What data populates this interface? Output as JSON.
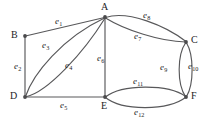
{
  "figure": {
    "type": "undirected-multigraph-diagram",
    "background_color": "#ffffff",
    "stroke_color": "#58585a",
    "text_color": "#1d1d1f",
    "width": 211,
    "height": 122
  },
  "vertices": [
    {
      "id": "A",
      "label": "A",
      "x": 105,
      "y": 17,
      "label_x": 101,
      "label_y": 2
    },
    {
      "id": "B",
      "label": "B",
      "x": 25,
      "y": 36,
      "label_x": 11,
      "label_y": 30
    },
    {
      "id": "C",
      "label": "C",
      "x": 186,
      "y": 42,
      "label_x": 191,
      "label_y": 35
    },
    {
      "id": "D",
      "label": "D",
      "x": 25,
      "y": 97,
      "label_x": 10,
      "label_y": 91
    },
    {
      "id": "E",
      "label": "E",
      "x": 105,
      "y": 97,
      "label_x": 101,
      "label_y": 101
    },
    {
      "id": "F",
      "label": "F",
      "x": 186,
      "y": 97,
      "label_x": 191,
      "label_y": 91
    }
  ],
  "edges": [
    {
      "id": "e1",
      "label": "e",
      "sub": "1",
      "from": "B",
      "to": "A",
      "shape": "straight",
      "label_x": 55,
      "label_y": 17
    },
    {
      "id": "e2",
      "label": "e",
      "sub": "2",
      "from": "B",
      "to": "D",
      "shape": "straight",
      "label_x": 14,
      "label_y": 62
    },
    {
      "id": "e3",
      "label": "e",
      "sub": "3",
      "from": "D",
      "to": "A",
      "shape": "curve-left",
      "label_x": 42,
      "label_y": 41
    },
    {
      "id": "e4",
      "label": "e",
      "sub": "4",
      "from": "D",
      "to": "A",
      "shape": "curve-right",
      "label_x": 65,
      "label_y": 61
    },
    {
      "id": "e5",
      "label": "e",
      "sub": "5",
      "from": "D",
      "to": "E",
      "shape": "straight",
      "label_x": 60,
      "label_y": 101
    },
    {
      "id": "e6",
      "label": "e",
      "sub": "6",
      "from": "A",
      "to": "E",
      "shape": "straight",
      "label_x": 97,
      "label_y": 54
    },
    {
      "id": "e7",
      "label": "e",
      "sub": "7",
      "from": "A",
      "to": "C",
      "shape": "curve-lower",
      "label_x": 134,
      "label_y": 32
    },
    {
      "id": "e8",
      "label": "e",
      "sub": "8",
      "from": "A",
      "to": "C",
      "shape": "curve-upper",
      "label_x": 143,
      "label_y": 11
    },
    {
      "id": "e9",
      "label": "e",
      "sub": "9",
      "from": "C",
      "to": "F",
      "shape": "curve-left",
      "label_x": 160,
      "label_y": 63
    },
    {
      "id": "e10",
      "label": "e",
      "sub": "10",
      "from": "C",
      "to": "F",
      "shape": "curve-right",
      "label_x": 188,
      "label_y": 62
    },
    {
      "id": "e11",
      "label": "e",
      "sub": "11",
      "from": "E",
      "to": "F",
      "shape": "curve-upper",
      "label_x": 133,
      "label_y": 77
    },
    {
      "id": "e12",
      "label": "e",
      "sub": "12",
      "from": "E",
      "to": "F",
      "shape": "curve-lower",
      "label_x": 134,
      "label_y": 108
    }
  ],
  "edge_paths": {
    "e1": "M 25.5 36 L 104.5 17.5",
    "e2": "M 25 36.5 L 25 96.5",
    "e3": "M 25.5 96.5 C 33 74, 62 38, 104.5 18",
    "e4": "M 26 96.8 C 48 92, 84 52, 104.8 18.5",
    "e5": "M 25.5 97 L 104.5 97",
    "e6": "M 105 18 L 105 96.5",
    "e7": "M 105.5 18 C 125 30, 160 41.5, 185.5 42",
    "e8": "M 105.5 17.5 C 128 10, 166 26, 186 41.5",
    "e9": "M 185.8 42.5 C 177 55, 177 84, 185.5 96.5",
    "e10": "M 186.3 42.5 C 194 55, 194 84, 186.5 96.5",
    "e11": "M 105.5 97 C 122 84, 168 84, 185.8 96.5",
    "e12": "M 105.5 97.5 C 122 111, 168 111, 185.8 97.3"
  }
}
